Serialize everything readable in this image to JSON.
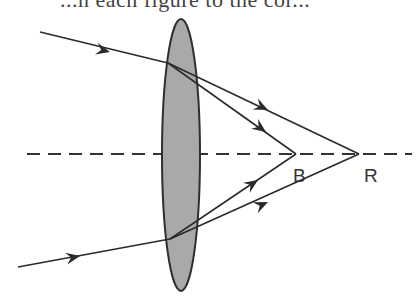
{
  "caption_fragment": "...n each figure to the cor...",
  "diagram": {
    "type": "lens-chromatic-aberration",
    "lens": {
      "fill": "#a9a9a9",
      "stroke": "#333333"
    },
    "axis": {
      "style": "dashed"
    },
    "focal_points": [
      {
        "label": "B",
        "meaning": "blue focus (closer to lens)"
      },
      {
        "label": "R",
        "meaning": "red focus (farther from lens)"
      }
    ],
    "rays": [
      {
        "name": "upper-incident-ray",
        "direction": "toward lens"
      },
      {
        "name": "upper-refracted-ray-red",
        "converges_to": "R"
      },
      {
        "name": "upper-refracted-ray-blue",
        "converges_to": "B"
      },
      {
        "name": "lower-incident-ray",
        "direction": "toward lens"
      },
      {
        "name": "lower-refracted-ray-blue",
        "converges_to": "B"
      },
      {
        "name": "lower-refracted-ray-red",
        "converges_to": "R"
      }
    ]
  },
  "labels": {
    "b": "B",
    "r": "R"
  }
}
